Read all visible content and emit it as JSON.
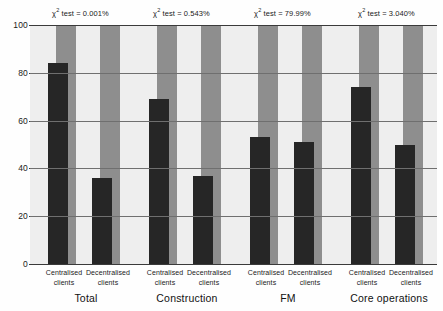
{
  "chart_data": {
    "type": "bar",
    "title": "",
    "subtitle": "",
    "xlabel": "",
    "ylabel": "",
    "ylim": [
      0,
      100
    ],
    "yticks": [
      0,
      20,
      40,
      60,
      80,
      100
    ],
    "ytick_labels": [
      "0",
      "20",
      "40",
      "60",
      "80",
      "100"
    ],
    "grid": true,
    "legend_position": "none",
    "categories": [
      "Centralised clients",
      "Decentralised clients",
      "Centralised clients",
      "Decentralised clients",
      "Centralised clients",
      "Decentralised clients",
      "Centralised clients",
      "Decentralised clients"
    ],
    "groups": [
      {
        "label": "Total",
        "annotation": "χ² test = 0.001%",
        "annotation_prefix": "χ",
        "annotation_sup": "2",
        "annotation_rest": " test = 0.001%",
        "bars": [
          {
            "category": "Centralised clients",
            "line1": "Centralised",
            "line2": "clients",
            "value": 84,
            "background": 100
          },
          {
            "category": "Decentralised clients",
            "line1": "Decentralised",
            "line2": "clients",
            "value": 36,
            "background": 100
          }
        ]
      },
      {
        "label": "Construction",
        "annotation": "χ² test = 0.543%",
        "annotation_prefix": "χ",
        "annotation_sup": "2",
        "annotation_rest": " test = 0.543%",
        "bars": [
          {
            "category": "Centralised clients",
            "line1": "Centralised",
            "line2": "clients",
            "value": 69,
            "background": 100
          },
          {
            "category": "Decentralised clients",
            "line1": "Decentralised",
            "line2": "clients",
            "value": 37,
            "background": 100
          }
        ]
      },
      {
        "label": "FM",
        "annotation": "χ² test = 79.99%",
        "annotation_prefix": "χ",
        "annotation_sup": "2",
        "annotation_rest": " test = 79.99%",
        "bars": [
          {
            "category": "Centralised clients",
            "line1": "Centralised",
            "line2": "clients",
            "value": 53,
            "background": 100
          },
          {
            "category": "Decentralised clients",
            "line1": "Decentralised",
            "line2": "clients",
            "value": 51,
            "background": 100
          }
        ]
      },
      {
        "label": "Core operations",
        "annotation": "χ² test = 3.040%",
        "annotation_prefix": "χ",
        "annotation_sup": "2",
        "annotation_rest": " test = 3.040%",
        "bars": [
          {
            "category": "Centralised clients",
            "line1": "Centralised",
            "line2": "clients",
            "value": 74,
            "background": 100
          },
          {
            "category": "Decentralised clients",
            "line1": "Decentralised",
            "line2": "clients",
            "value": 50,
            "background": 100
          }
        ]
      }
    ],
    "series": [
      {
        "name": "value",
        "values": [
          84,
          36,
          69,
          37,
          53,
          51,
          74,
          50
        ]
      },
      {
        "name": "background",
        "values": [
          100,
          100,
          100,
          100,
          100,
          100,
          100,
          100
        ]
      }
    ],
    "colors": {
      "bar_value": "#262626",
      "bar_background": "#8e8e8e",
      "plot_background": "#eeeeee",
      "axis": "#3a3a3a",
      "gridline": "#6f6f6f",
      "text": "#1a1a1a",
      "page_background": "#fefefe"
    }
  }
}
